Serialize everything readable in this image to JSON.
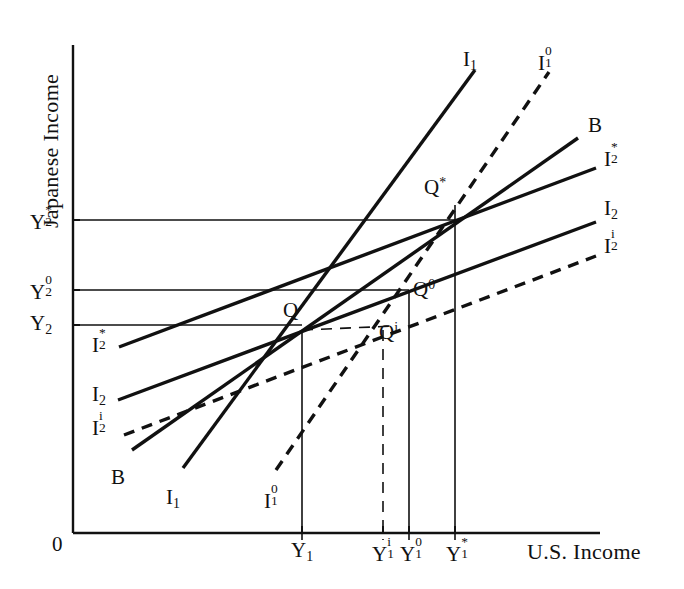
{
  "figure": {
    "title": "",
    "axes": {
      "x_label": "U.S. Income",
      "y_label": "Japanese Income",
      "origin_label": "0"
    }
  },
  "chart_data": {
    "type": "line",
    "title": "",
    "xlabel": "U.S. Income",
    "ylabel": "Japanese Income",
    "grid": false,
    "legend_position": "inline-endpoints",
    "x_ticks": [
      {
        "label_base": "Y",
        "sub": "1",
        "sup": "",
        "display": "Y1",
        "x_px": 302
      },
      {
        "label_base": "Y",
        "sub": "1",
        "sup": "i",
        "display": "Y1i",
        "x_px": 383
      },
      {
        "label_base": "Y",
        "sub": "1",
        "sup": "0",
        "display": "Y10",
        "x_px": 409
      },
      {
        "label_base": "Y",
        "sub": "1",
        "sup": "*",
        "display": "Y1*",
        "x_px": 455
      }
    ],
    "y_ticks": [
      {
        "label_base": "Y",
        "sub": "2",
        "sup": "*",
        "display": "Y2*",
        "y_px": 220
      },
      {
        "label_base": "Y",
        "sub": "2",
        "sup": "0",
        "display": "Y20",
        "y_px": 290
      },
      {
        "label_base": "Y",
        "sub": "2",
        "sup": "",
        "display": "Y2",
        "y_px": 325
      }
    ],
    "points": [
      {
        "name": "Q",
        "label_base": "Q",
        "sup": "",
        "x_px": 302,
        "y_px": 330,
        "label_x": 283,
        "label_y": 300
      },
      {
        "name": "Q*",
        "label_base": "Q",
        "sup": "*",
        "x_px": 443,
        "y_px": 205,
        "label_x": 424,
        "label_y": 177
      },
      {
        "name": "Q0",
        "label_base": "Q",
        "sup": "0",
        "x_px": 409,
        "y_px": 290,
        "label_x": 413,
        "label_y": 281
      },
      {
        "name": "Qi",
        "label_base": "Q",
        "sup": "i",
        "x_px": 383,
        "y_px": 330,
        "label_x": 379,
        "label_y": 322
      }
    ],
    "curves": [
      {
        "name": "I1",
        "label_base": "I",
        "sub": "1",
        "sup": "",
        "style": "solid",
        "start_label": {
          "text": "I1",
          "x": 166,
          "y": 487
        },
        "end_label": {
          "text": "I1",
          "x": 463,
          "y": 49
        },
        "x1": 183,
        "y1": 468,
        "x2": 475,
        "y2": 70
      },
      {
        "name": "I1_0",
        "label_base": "I",
        "sub": "1",
        "sup": "0",
        "style": "dashed",
        "start_label": {
          "text": "I10",
          "x": 264,
          "y": 487
        },
        "end_label": {
          "text": "I10",
          "x": 538,
          "y": 49
        },
        "x1": 276,
        "y1": 470,
        "x2": 549,
        "y2": 72
      },
      {
        "name": "B",
        "label_base": "B",
        "sub": "",
        "sup": "",
        "style": "solid",
        "start_label": {
          "text": "B",
          "x": 111,
          "y": 467
        },
        "end_label": {
          "text": "B",
          "x": 588,
          "y": 115
        },
        "x1": 132,
        "y1": 450,
        "x2": 578,
        "y2": 138
      },
      {
        "name": "I2_star",
        "label_base": "I",
        "sub": "2",
        "sup": "*",
        "style": "solid",
        "start_label": {
          "text": "I2*",
          "x": 92,
          "y": 331
        },
        "end_label": {
          "text": "I2*",
          "x": 604,
          "y": 145
        },
        "x1": 119,
        "y1": 347,
        "x2": 596,
        "y2": 168
      },
      {
        "name": "I2",
        "label_base": "I",
        "sub": "2",
        "sup": "",
        "style": "solid",
        "start_label": {
          "text": "I2",
          "x": 92,
          "y": 384
        },
        "end_label": {
          "text": "I2",
          "x": 604,
          "y": 198
        },
        "x1": 118,
        "y1": 400,
        "x2": 596,
        "y2": 222
      },
      {
        "name": "I2_i",
        "label_base": "I",
        "sub": "2",
        "sup": "i",
        "style": "dashed",
        "start_label": {
          "text": "I2i",
          "x": 92,
          "y": 414
        },
        "end_label": {
          "text": "I2i",
          "x": 604,
          "y": 232
        },
        "x1": 124,
        "y1": 435,
        "x2": 596,
        "y2": 256
      }
    ],
    "guide_lines": [
      {
        "name": "y2-star-horizontal",
        "style": "solid",
        "x1": 73,
        "y1": 220,
        "x2": 455,
        "y2": 220
      },
      {
        "name": "y2-zero-horizontal",
        "style": "solid",
        "x1": 73,
        "y1": 290,
        "x2": 409,
        "y2": 290
      },
      {
        "name": "y2-horizontal",
        "style": "solid",
        "x1": 73,
        "y1": 325,
        "x2": 302,
        "y2": 325
      },
      {
        "name": "y1-vertical",
        "style": "solid",
        "x1": 302,
        "y1": 330,
        "x2": 302,
        "y2": 540
      },
      {
        "name": "y1-zero-vertical",
        "style": "solid",
        "x1": 409,
        "y1": 290,
        "x2": 409,
        "y2": 540
      },
      {
        "name": "y1-star-vertical",
        "style": "solid",
        "x1": 455,
        "y1": 205,
        "x2": 455,
        "y2": 540
      },
      {
        "name": "y1-i-vertical",
        "style": "dashed",
        "x1": 383,
        "y1": 330,
        "x2": 383,
        "y2": 540
      },
      {
        "name": "q-to-qi-horizontal",
        "style": "dashed",
        "x1": 302,
        "y1": 330,
        "x2": 395,
        "y2": 326
      }
    ],
    "axis_ranges": {
      "x_px": [
        73,
        600
      ],
      "y_px": [
        45,
        533
      ]
    }
  }
}
